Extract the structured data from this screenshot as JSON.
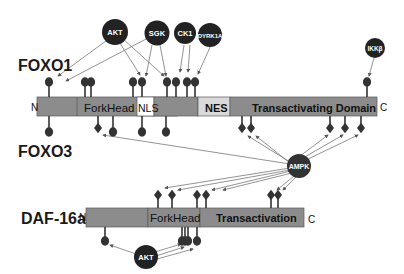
{
  "colors": {
    "protein_bar": "#8c8c8c",
    "protein_bar_stroke": "#5a5a5a",
    "light_domain": "#d9d9d9",
    "white_domain": "#ffffff",
    "kinase_fill": "#222222",
    "site_fill": "#333333",
    "arrow": "#666666"
  },
  "proteins": [
    {
      "name": "FOXO1",
      "n_term": "N",
      "c_term": "C"
    },
    {
      "name": "FOXO3"
    },
    {
      "name": "DAF-16a",
      "n_term": "N",
      "c_term": "C"
    }
  ],
  "foxo_domains": [
    {
      "label": "ForkHead"
    },
    {
      "label": "NLS"
    },
    {
      "label": "NES"
    },
    {
      "label": "Transactivating Domain"
    }
  ],
  "daf16_domains": [
    {
      "label": "ForkHead"
    },
    {
      "label": "Transactivation"
    }
  ],
  "kinases": [
    {
      "label": "AKT"
    },
    {
      "label": "SGK"
    },
    {
      "label": "CK1"
    },
    {
      "label": "DYRK1A"
    },
    {
      "label": "IKKβ"
    },
    {
      "label": "AMPK"
    },
    {
      "label": "AKT"
    }
  ]
}
